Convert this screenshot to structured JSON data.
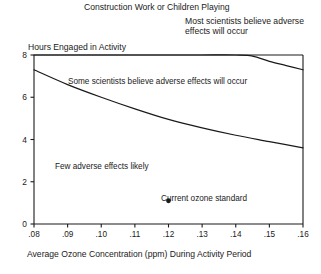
{
  "chart_data": {
    "type": "line",
    "title": "Construction Work or Children Playing",
    "xlabel": "Average Ozone Concentration (ppm) During Activity Period",
    "ylabel": "Hours Engaged in Activity",
    "xlim": [
      0.08,
      0.16
    ],
    "ylim": [
      0,
      8
    ],
    "grid": false,
    "legend_position": "none",
    "xticks": [
      ".08",
      ".09",
      ".10",
      ".11",
      ".12",
      ".13",
      ".14",
      ".15",
      ".16"
    ],
    "xtick_values": [
      0.08,
      0.09,
      0.1,
      0.11,
      0.12,
      0.13,
      0.14,
      0.15,
      0.16
    ],
    "yticks": [
      "0",
      "2",
      "4",
      "6",
      "8"
    ],
    "ytick_values": [
      0,
      2,
      4,
      6,
      8
    ],
    "series": [
      {
        "name": "Upper threshold (most scientists believe adverse effects will occur)",
        "x": [
          0.08,
          0.1,
          0.12,
          0.13,
          0.14,
          0.145,
          0.15,
          0.155,
          0.16
        ],
        "values": [
          8.0,
          8.0,
          8.0,
          8.0,
          8.0,
          7.95,
          7.7,
          7.5,
          7.3
        ]
      },
      {
        "name": "Lower threshold (some scientists believe adverse effects will occur)",
        "x": [
          0.08,
          0.09,
          0.1,
          0.11,
          0.12,
          0.13,
          0.14,
          0.15,
          0.16
        ],
        "values": [
          7.3,
          6.6,
          6.0,
          5.45,
          4.95,
          4.55,
          4.2,
          3.9,
          3.6
        ]
      }
    ],
    "annotations": [
      {
        "name": "upper-region-label",
        "text": "Most scientists believe adverse effects will occur",
        "x": 0.145,
        "y": 8.6
      },
      {
        "name": "mid-region-label",
        "text": "Some scientists believe adverse effects will occur",
        "x": 0.115,
        "y": 6.9
      },
      {
        "name": "low-region-label",
        "text": "Few adverse effects likely",
        "x": 0.1,
        "y": 3.1
      }
    ],
    "markers": [
      {
        "name": "current-ozone-standard",
        "label": "Current ozone standard",
        "x": 0.12,
        "y": 1.1,
        "shape": "filled-circle"
      }
    ]
  },
  "chart": {
    "title": "Construction Work or Children Playing",
    "y_axis_title": "Hours Engaged in Activity",
    "x_axis_title": "Average Ozone Concentration (ppm) During Activity Period",
    "upper_region_label": "Most scientists believe adverse effects will occur",
    "mid_region_label": "Some scientists believe adverse effects will occur",
    "low_region_label": "Few adverse effects likely",
    "standard_marker_label": "Current ozone standard",
    "caption_fragment": ""
  },
  "colors": {
    "ink": "#1a1a1a",
    "background": "#ffffff",
    "axis": "#1a1a1a",
    "curve": "#1a1a1a"
  }
}
